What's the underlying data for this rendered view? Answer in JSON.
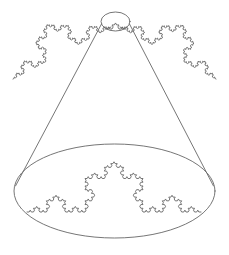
{
  "figure": {
    "width": 229,
    "height": 255,
    "background_color": "#ffffff",
    "stroke_color": "#666666",
    "stroke_width": 0.9
  },
  "geometry": {
    "apex_ellipse": {
      "label": "apex-ellipse",
      "cx": 115.5,
      "cy": 21.5,
      "rx": 14.5,
      "ry": 9.5
    },
    "base_ellipse": {
      "label": "base-ellipse",
      "cx": 114.5,
      "cy": 191,
      "rx": 100.5,
      "ry": 47
    },
    "cone_left_side": {
      "label": "cone-left-side",
      "x1": 101.5,
      "y1": 24,
      "x2": 15.5,
      "y2": 186
    },
    "cone_right_side": {
      "label": "cone-right-side",
      "x1": 129.5,
      "y1": 24,
      "x2": 213.5,
      "y2": 186
    }
  },
  "koch_curves": [
    {
      "label": "top-left-koch-curve",
      "name": "koch-top-left",
      "order": 4,
      "x1": 13,
      "y1": 79,
      "x2": 111,
      "y2": 27,
      "bulge": "up"
    },
    {
      "label": "top-right-koch-curve",
      "name": "koch-top-right",
      "order": 4,
      "x1": 120,
      "y1": 27,
      "x2": 216,
      "y2": 79,
      "bulge": "up"
    },
    {
      "label": "apex-koch-curve",
      "name": "koch-apex",
      "order": 2,
      "x1": 105,
      "y1": 29,
      "x2": 126,
      "y2": 29,
      "bulge": "up"
    },
    {
      "label": "base-koch-curve",
      "name": "koch-base",
      "order": 4,
      "x1": 27,
      "y1": 212,
      "x2": 201,
      "y2": 212,
      "bulge": "up"
    }
  ],
  "chart_data": {
    "type": "line",
    "series": [
      {
        "name": "apex-ellipse",
        "shape": "ellipse",
        "center": [
          115.5,
          21.5
        ],
        "radii": [
          14.5,
          9.5
        ]
      },
      {
        "name": "base-ellipse",
        "shape": "ellipse",
        "center": [
          114.5,
          191
        ],
        "radii": [
          100.5,
          47
        ]
      },
      {
        "name": "cone-left-side",
        "shape": "line",
        "points": [
          [
            101.5,
            24
          ],
          [
            15.5,
            186
          ]
        ]
      },
      {
        "name": "cone-right-side",
        "shape": "line",
        "points": [
          [
            129.5,
            24
          ],
          [
            213.5,
            186
          ]
        ]
      },
      {
        "name": "koch-top-left",
        "shape": "koch",
        "endpoints": [
          [
            13,
            79
          ],
          [
            111,
            27
          ]
        ],
        "order": 4
      },
      {
        "name": "koch-top-right",
        "shape": "koch",
        "endpoints": [
          [
            120,
            27
          ],
          [
            216,
            79
          ]
        ],
        "order": 4
      },
      {
        "name": "koch-apex",
        "shape": "koch",
        "endpoints": [
          [
            105,
            29
          ],
          [
            126,
            29
          ]
        ],
        "order": 2
      },
      {
        "name": "koch-base",
        "shape": "koch",
        "endpoints": [
          [
            27,
            212
          ],
          [
            201,
            212
          ]
        ],
        "order": 4
      }
    ],
    "xlabel": "",
    "ylabel": "",
    "grid": false,
    "legend": false
  }
}
